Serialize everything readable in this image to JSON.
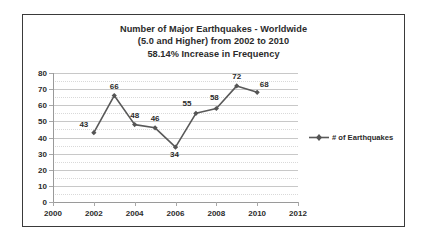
{
  "chart_data": {
    "type": "line",
    "title": "Number of Major Earthquakes - Worldwide",
    "subtitle": "(5.0 and Higher) from 2002 to 2010",
    "subtitle2": "58.14% Increase in Frequency",
    "xlabel": "",
    "ylabel": "",
    "x": [
      2002,
      2003,
      2004,
      2005,
      2006,
      2007,
      2008,
      2009,
      2010
    ],
    "values": [
      43,
      66,
      48,
      46,
      34,
      55,
      58,
      72,
      68
    ],
    "point_labels": [
      "43",
      "66",
      "48",
      "46",
      "34",
      "55",
      "58",
      "72",
      "68"
    ],
    "series": [
      {
        "name": "# of Earthquakes",
        "values": [
          43,
          66,
          48,
          46,
          34,
          55,
          58,
          72,
          68
        ],
        "color": "#595959",
        "marker": "diamond"
      }
    ],
    "xlim": [
      2000,
      2012
    ],
    "ylim": [
      0,
      80
    ],
    "x_ticks": [
      "2000",
      "2002",
      "2004",
      "2006",
      "2008",
      "2010",
      "2012"
    ],
    "x_tick_values": [
      2000,
      2002,
      2004,
      2006,
      2008,
      2010,
      2012
    ],
    "y_ticks": [
      "0",
      "10",
      "20",
      "30",
      "40",
      "50",
      "60",
      "70",
      "80"
    ],
    "y_tick_values": [
      0,
      10,
      20,
      30,
      40,
      50,
      60,
      70,
      80
    ],
    "grid": true,
    "legend_position": "right",
    "legend_entries": [
      "# of Earthquakes"
    ]
  },
  "legend": {
    "label": "# of Earthquakes",
    "marker_icon": "diamond-marker-icon",
    "line_color": "#595959"
  },
  "colors": {
    "series": "#595959",
    "text": "#2b2b2b",
    "gridline": "#c8c8c8",
    "minor_gridline": "#d9d9d9",
    "axis": "#9a9a9a",
    "frame": "#3a3a3a",
    "background": "#ffffff"
  }
}
